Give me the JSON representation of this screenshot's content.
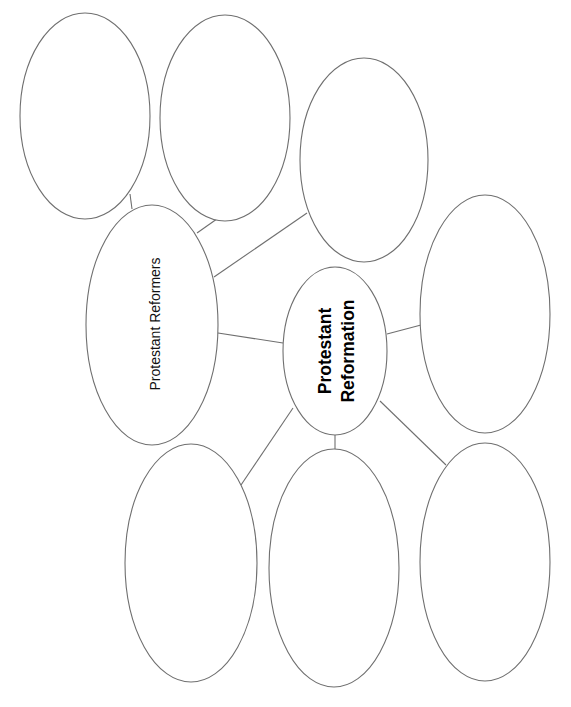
{
  "diagram": {
    "type": "bubble-map",
    "colors": {
      "background": "#ffffff",
      "stroke": "#6f6f6f",
      "text": "#000000"
    },
    "center": {
      "line1": "Protestant",
      "line2": "Reformation"
    },
    "reformers": {
      "label": "Protestant Reformers"
    },
    "blank_bubbles": [
      {
        "id": "reformer-1",
        "text": ""
      },
      {
        "id": "reformer-2",
        "text": ""
      },
      {
        "id": "reformer-3",
        "text": ""
      },
      {
        "id": "detail-right",
        "text": ""
      },
      {
        "id": "detail-bottom-left",
        "text": ""
      },
      {
        "id": "detail-bottom-center",
        "text": ""
      },
      {
        "id": "detail-bottom-right",
        "text": ""
      }
    ]
  }
}
